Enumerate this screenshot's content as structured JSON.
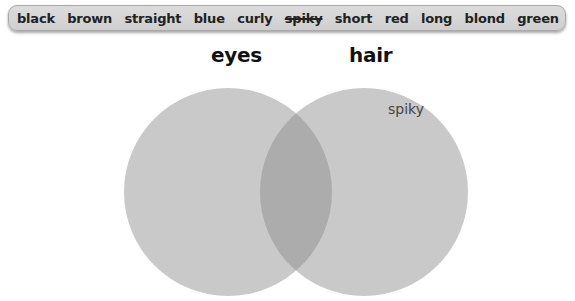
{
  "word_bank": {
    "words": [
      {
        "label": "black",
        "used": false
      },
      {
        "label": "brown",
        "used": false
      },
      {
        "label": "straight",
        "used": false
      },
      {
        "label": "blue",
        "used": false
      },
      {
        "label": "curly",
        "used": false
      },
      {
        "label": "spiky",
        "used": true
      },
      {
        "label": "short",
        "used": false
      },
      {
        "label": "red",
        "used": false
      },
      {
        "label": "long",
        "used": false
      },
      {
        "label": "blond",
        "used": false
      },
      {
        "label": "green",
        "used": false
      }
    ]
  },
  "venn": {
    "left_label": "eyes",
    "right_label": "hair",
    "circle_color": "#c9c9c9",
    "overlap_color": "#ababab",
    "placed_words": [
      {
        "label": "spiky",
        "region": "hair"
      }
    ]
  }
}
